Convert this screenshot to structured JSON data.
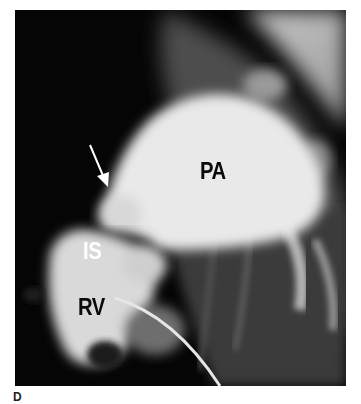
{
  "figure": {
    "panel_letter": "D",
    "labels": {
      "pa": "PA",
      "is": "IS",
      "rv": "RV"
    },
    "arrow": {
      "color": "#ffffff",
      "points_to": "PA-IS junction"
    },
    "colors": {
      "background": "#050505",
      "vessel_bright": "#e8e8e8",
      "soft_tissue": "#5a5a5a",
      "page": "#ffffff"
    }
  }
}
